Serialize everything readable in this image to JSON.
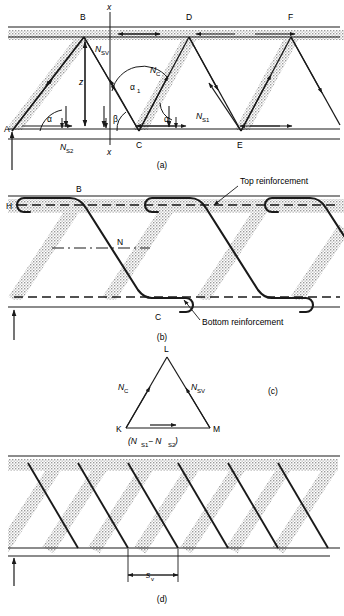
{
  "figure": {
    "type": "engineering-diagram",
    "panels": [
      {
        "key": "a",
        "caption": "(a)",
        "nodes": [
          {
            "name": "A",
            "x": 12,
            "y": 129
          },
          {
            "name": "B",
            "x": 84,
            "y": 24
          },
          {
            "name": "C",
            "x": 139,
            "y": 129
          },
          {
            "name": "D",
            "x": 189,
            "y": 24
          },
          {
            "name": "E",
            "x": 241,
            "y": 129
          },
          {
            "name": "F",
            "x": 291,
            "y": 24
          }
        ],
        "section_marks": [
          "x",
          "x"
        ],
        "force_labels": [
          {
            "text": "N",
            "sub": "SV"
          },
          {
            "text": "N",
            "sub": "C"
          },
          {
            "text": "N",
            "sub": "S1"
          },
          {
            "text": "N",
            "sub": "S2"
          }
        ],
        "dimension_labels": [
          {
            "text": "z"
          }
        ],
        "angle_labels": [
          {
            "text": "α"
          },
          {
            "text": "β"
          },
          {
            "text": "α",
            "sub": "1"
          },
          {
            "text": "α"
          }
        ]
      },
      {
        "key": "b",
        "caption": "(b)",
        "nodes": [
          {
            "name": "H",
            "x": 12,
            "y": 206
          },
          {
            "name": "B",
            "x": 80,
            "y": 190
          },
          {
            "name": "N",
            "x": 120,
            "y": 243
          },
          {
            "name": "C",
            "x": 158,
            "y": 300
          }
        ],
        "annotations": [
          {
            "text": "Top reinforcement"
          },
          {
            "text": "Bottom reinforcement"
          }
        ]
      },
      {
        "key": "c",
        "caption": "(c)",
        "nodes": [
          {
            "name": "L",
            "x": 167,
            "y": 352
          },
          {
            "name": "K",
            "x": 126,
            "y": 428
          },
          {
            "name": "M",
            "x": 210,
            "y": 428
          }
        ],
        "edge_labels": [
          {
            "text": "N",
            "sub": "C"
          },
          {
            "text": "N",
            "sub": "SV"
          },
          {
            "text": "(N",
            "sub": "S1",
            "text2": " − N",
            "sub2": "S2",
            "text3": ")"
          }
        ]
      },
      {
        "key": "d",
        "caption": "(d)",
        "dimension_labels": [
          {
            "text": "s",
            "sub": "v"
          }
        ]
      }
    ],
    "colors": {
      "line": "#1a1a1a",
      "hatch": "#b9b9b9",
      "hatch_light": "#d2d2d2",
      "background": "#ffffff"
    }
  }
}
